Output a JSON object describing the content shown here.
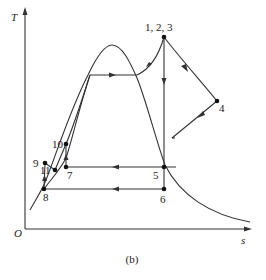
{
  "figure": {
    "caption": "(b)",
    "axes": {
      "y_label": "T",
      "x_label": "s",
      "origin_label": "O"
    },
    "points": [
      {
        "id": "p123",
        "label": "1, 2, 3"
      },
      {
        "id": "p4",
        "label": "4"
      },
      {
        "id": "p5",
        "label": "5"
      },
      {
        "id": "p6",
        "label": "6"
      },
      {
        "id": "p7",
        "label": "7"
      },
      {
        "id": "p8",
        "label": "8"
      },
      {
        "id": "p9",
        "label": "9"
      },
      {
        "id": "p10",
        "label": "10"
      },
      {
        "id": "p11",
        "label": "11"
      }
    ],
    "colors": {
      "line": "#333333",
      "point": "#111111",
      "background": "#ffffff"
    }
  }
}
